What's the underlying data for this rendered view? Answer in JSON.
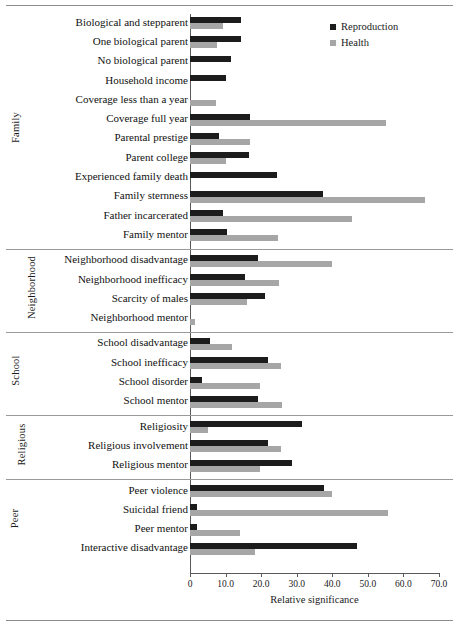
{
  "chart_data": {
    "type": "bar",
    "orientation": "horizontal",
    "title": "",
    "xlabel": "Relative significance",
    "ylabel": "",
    "xlim": [
      0,
      70
    ],
    "xticks": [
      "0",
      "10.0",
      "20.0",
      "30.0",
      "40.0",
      "50.0",
      "60.0",
      "70.0"
    ],
    "xtick_values": [
      0,
      10,
      20,
      30,
      40,
      50,
      60,
      70
    ],
    "grid": false,
    "legend_position": "top-right",
    "series": [
      {
        "name": "Reproduction",
        "color": "#1c1c1c"
      },
      {
        "name": "Health",
        "color": "#a6a6a6"
      }
    ],
    "groups": [
      {
        "label": "Family",
        "categories": [
          "Biological and stepparent",
          "One biological parent",
          "No biological parent",
          "Household income",
          "Coverage less than a year",
          "Coverage full year",
          "Parental prestige",
          "Parent college",
          "Experienced family death",
          "Family sternness",
          "Father incarcerated",
          "Family mentor"
        ],
        "reproduction": [
          14.4,
          14.4,
          11.6,
          10.2,
          0.0,
          17.0,
          8.2,
          16.5,
          24.5,
          37.5,
          9.4,
          10.4
        ],
        "health": [
          9.4,
          7.6,
          0.0,
          0.0,
          7.3,
          55.0,
          17.0,
          10.0,
          0.0,
          66.0,
          45.5,
          24.6
        ]
      },
      {
        "label": "Neighborhood",
        "categories": [
          "Neighborhood disadvantage",
          "Neighborhood inefficacy",
          "Scarcity of males",
          "Neighborhood mentor"
        ],
        "reproduction": [
          19.0,
          15.5,
          21.0,
          0.0
        ],
        "health": [
          40.0,
          25.0,
          16.0,
          1.3
        ]
      },
      {
        "label": "School",
        "categories": [
          "School disadvantage",
          "School inefficacy",
          "School disorder",
          "School mentor"
        ],
        "reproduction": [
          5.7,
          22.0,
          3.3,
          19.0
        ],
        "health": [
          11.8,
          25.5,
          19.8,
          26.0
        ]
      },
      {
        "label": "Religious",
        "categories": [
          "Religiosity",
          "Religious involvement",
          "Religious mentor"
        ],
        "reproduction": [
          31.6,
          22.0,
          28.8
        ],
        "health": [
          5.0,
          25.5,
          19.8
        ]
      },
      {
        "label": "Peer",
        "categories": [
          "Peer violence",
          "Suicidal friend",
          "Peer mentor",
          "Interactive disadvantage"
        ],
        "reproduction": [
          37.6,
          2.0,
          2.0,
          47.0
        ],
        "health": [
          40.0,
          55.6,
          14.0,
          18.4
        ]
      }
    ]
  }
}
